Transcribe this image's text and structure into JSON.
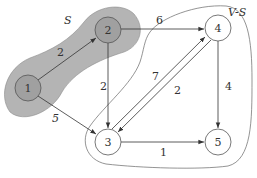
{
  "diagram": {
    "type": "directed-weighted-graph",
    "regions": [
      {
        "id": "S",
        "label": "S",
        "fill": "#b4b4b4",
        "members": [
          "1",
          "2"
        ]
      },
      {
        "id": "V-S",
        "label": "V-S",
        "fill": "none",
        "members": [
          "3",
          "4",
          "5"
        ]
      }
    ],
    "nodes": [
      {
        "id": "1",
        "label": "1",
        "x": 28,
        "y": 88,
        "shaded": true
      },
      {
        "id": "2",
        "label": "2",
        "x": 108,
        "y": 30,
        "shaded": true
      },
      {
        "id": "3",
        "label": "3",
        "x": 108,
        "y": 142,
        "shaded": false
      },
      {
        "id": "4",
        "label": "4",
        "x": 218,
        "y": 28,
        "shaded": false
      },
      {
        "id": "5",
        "label": "5",
        "x": 218,
        "y": 142,
        "shaded": false
      }
    ],
    "edges": [
      {
        "from": "1",
        "to": "2",
        "weight": "2"
      },
      {
        "from": "1",
        "to": "3",
        "weight": "5"
      },
      {
        "from": "2",
        "to": "4",
        "weight": "6"
      },
      {
        "from": "2",
        "to": "3",
        "weight": "2"
      },
      {
        "from": "3",
        "to": "4",
        "weight": "7"
      },
      {
        "from": "4",
        "to": "3",
        "weight": "2"
      },
      {
        "from": "4",
        "to": "5",
        "weight": "4"
      },
      {
        "from": "3",
        "to": "5",
        "weight": "1"
      }
    ],
    "colors": {
      "region_fill": "#b4b4b4",
      "node_shaded": "#a0a0a0",
      "stroke": "#444444"
    }
  }
}
